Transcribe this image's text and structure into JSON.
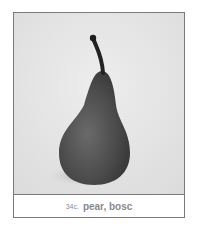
{
  "card": {
    "image_subject": "pear-image",
    "code": "34c.",
    "name": "pear, bosc"
  }
}
